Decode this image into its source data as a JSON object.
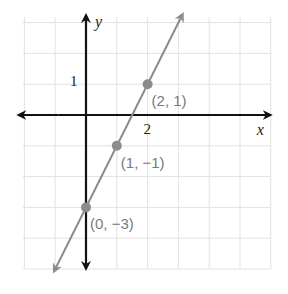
{
  "chart_data": {
    "type": "line",
    "title": "",
    "xlabel": "x",
    "ylabel": "y",
    "xlim": [
      -2,
      6
    ],
    "ylim": [
      -5,
      3
    ],
    "grid": true,
    "x_ticks_labeled": [
      {
        "value": 2,
        "label": "2"
      }
    ],
    "y_ticks_labeled": [
      {
        "value": 1,
        "label": "1"
      }
    ],
    "series": [
      {
        "name": "y = 2x - 3",
        "color": "#8c8c8c",
        "line": {
          "slope": 2,
          "intercept": -3,
          "x_range": [
            -1,
            3.1
          ]
        },
        "points": [
          {
            "x": 2,
            "y": 1,
            "label": "(2, 1)"
          },
          {
            "x": 1,
            "y": -1,
            "label": "(1, −1)"
          },
          {
            "x": 0,
            "y": -3,
            "label": "(0, −3)"
          }
        ]
      }
    ]
  }
}
